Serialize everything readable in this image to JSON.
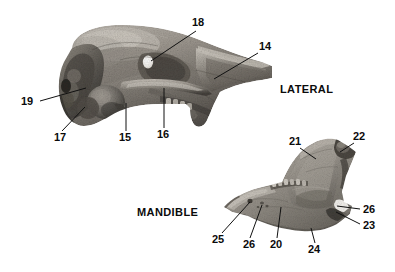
{
  "figure": {
    "background_color": "#ffffff",
    "label_color": "#0b0b0b",
    "leader_color": "#111111",
    "bone_light": "#d8d4cd",
    "bone_mid": "#9c978f",
    "bone_dark": "#55514c",
    "bone_shadow": "#2e2c29"
  },
  "view_labels": [
    {
      "id": "lateral",
      "text": "LATERAL"
    },
    {
      "id": "mandible",
      "text": "MANDIBLE"
    }
  ],
  "specimens": [
    {
      "id": "skull-lateral",
      "name": "skull-lateral-view"
    },
    {
      "id": "mandible-lateral",
      "name": "mandible-lateral-view"
    }
  ],
  "callouts": [
    {
      "id": "c18",
      "text": "18",
      "specimen": "skull-lateral"
    },
    {
      "id": "c14",
      "text": "14",
      "specimen": "skull-lateral"
    },
    {
      "id": "c19",
      "text": "19",
      "specimen": "skull-lateral"
    },
    {
      "id": "c17",
      "text": "17",
      "specimen": "skull-lateral"
    },
    {
      "id": "c15",
      "text": "15",
      "specimen": "skull-lateral"
    },
    {
      "id": "c16",
      "text": "16",
      "specimen": "skull-lateral"
    },
    {
      "id": "c21",
      "text": "21",
      "specimen": "mandible-lateral"
    },
    {
      "id": "c22",
      "text": "22",
      "specimen": "mandible-lateral"
    },
    {
      "id": "c26r",
      "text": "26",
      "specimen": "mandible-lateral"
    },
    {
      "id": "c23",
      "text": "23",
      "specimen": "mandible-lateral"
    },
    {
      "id": "c25",
      "text": "25",
      "specimen": "mandible-lateral"
    },
    {
      "id": "c26b",
      "text": "26",
      "specimen": "mandible-lateral"
    },
    {
      "id": "c20",
      "text": "20",
      "specimen": "mandible-lateral"
    },
    {
      "id": "c24",
      "text": "24",
      "specimen": "mandible-lateral"
    }
  ]
}
